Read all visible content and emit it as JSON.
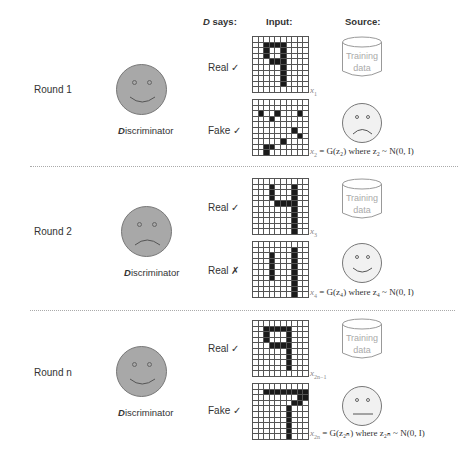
{
  "header": {
    "d_says_prefix": "D",
    "d_says_suffix": " says:",
    "input": "Input:",
    "source": "Source:"
  },
  "rounds": [
    {
      "label": "Round 1",
      "discriminator_mood": "happy",
      "discriminator_label_prefix": "D",
      "discriminator_label_suffix": "iscriminator",
      "rows": [
        {
          "verdict": "Real ✓",
          "digit": "9",
          "caption_var": "x",
          "caption_sub": "1",
          "caption_rest": "",
          "source": "training-data",
          "source_text": [
            "Training",
            "data"
          ]
        },
        {
          "verdict": "Fake ✓",
          "digit": "noise",
          "caption_var": "x",
          "caption_sub": "2",
          "caption_rest": " = G(z₂) where z₂  ~ N(0, I)",
          "source": "generator-sad"
        }
      ]
    },
    {
      "label": "Round 2",
      "discriminator_mood": "sad",
      "discriminator_label_prefix": "D",
      "discriminator_label_suffix": "iscriminator",
      "rows": [
        {
          "verdict": "Real ✓",
          "digit": "4",
          "caption_var": "x",
          "caption_sub": "3",
          "caption_rest": "",
          "source": "training-data",
          "source_text": [
            "Training",
            "data"
          ]
        },
        {
          "verdict": "Real ✗",
          "digit": "fake-4",
          "caption_var": "x",
          "caption_sub": "4",
          "caption_rest": " = G(z₄) where z₄  ~ N(0, I)",
          "source": "generator-happy"
        }
      ]
    },
    {
      "label": "Round n",
      "discriminator_mood": "happy",
      "discriminator_label_prefix": "D",
      "discriminator_label_suffix": "iscriminator",
      "rows": [
        {
          "verdict": "Real ✓",
          "digit": "9",
          "caption_var": "x",
          "caption_sub": "2n−1",
          "caption_rest": "",
          "source": "training-data",
          "source_text": [
            "Training",
            "data"
          ]
        },
        {
          "verdict": "Fake ✓",
          "digit": "7",
          "caption_var": "x",
          "caption_sub": "2n",
          "caption_rest": " = G(z₂ₙ) where z₂ₙ  ~ N(0, I)",
          "source": "generator-neutral"
        }
      ]
    }
  ],
  "grids": {
    "r1_real": [
      [
        1,
        2
      ],
      [
        1,
        3
      ],
      [
        1,
        4
      ],
      [
        1,
        5
      ],
      [
        2,
        2
      ],
      [
        2,
        5
      ],
      [
        3,
        2
      ],
      [
        3,
        5
      ],
      [
        4,
        3
      ],
      [
        4,
        4
      ],
      [
        4,
        5
      ],
      [
        5,
        5
      ],
      [
        6,
        5
      ],
      [
        7,
        5
      ],
      [
        8,
        5
      ]
    ],
    "r1_fake": [
      [
        2,
        1
      ],
      [
        2,
        4
      ],
      [
        2,
        8
      ],
      [
        3,
        3
      ],
      [
        5,
        7
      ],
      [
        6,
        8
      ],
      [
        7,
        5
      ],
      [
        8,
        2
      ],
      [
        8,
        3
      ],
      [
        9,
        2
      ]
    ],
    "r2_real": [
      [
        1,
        3
      ],
      [
        1,
        7
      ],
      [
        2,
        3
      ],
      [
        2,
        7
      ],
      [
        3,
        3
      ],
      [
        3,
        7
      ],
      [
        4,
        4
      ],
      [
        4,
        5
      ],
      [
        4,
        6
      ],
      [
        4,
        7
      ],
      [
        5,
        7
      ],
      [
        6,
        7
      ],
      [
        7,
        7
      ],
      [
        8,
        7
      ],
      [
        9,
        7
      ]
    ],
    "r2_fake": [
      [
        1,
        7
      ],
      [
        2,
        3
      ],
      [
        2,
        7
      ],
      [
        3,
        3
      ],
      [
        3,
        7
      ],
      [
        4,
        3
      ],
      [
        4,
        7
      ],
      [
        5,
        3
      ],
      [
        5,
        7
      ],
      [
        6,
        3
      ],
      [
        6,
        7
      ],
      [
        7,
        7
      ],
      [
        8,
        7
      ],
      [
        9,
        7
      ]
    ],
    "rn_real": [
      [
        1,
        2
      ],
      [
        1,
        3
      ],
      [
        1,
        4
      ],
      [
        1,
        5
      ],
      [
        1,
        6
      ],
      [
        2,
        2
      ],
      [
        2,
        6
      ],
      [
        3,
        2
      ],
      [
        3,
        6
      ],
      [
        4,
        3
      ],
      [
        4,
        4
      ],
      [
        4,
        5
      ],
      [
        4,
        6
      ],
      [
        5,
        6
      ],
      [
        6,
        6
      ],
      [
        7,
        6
      ],
      [
        8,
        6
      ]
    ],
    "rn_fake": [
      [
        1,
        2
      ],
      [
        1,
        3
      ],
      [
        1,
        4
      ],
      [
        1,
        5
      ],
      [
        1,
        6
      ],
      [
        1,
        7
      ],
      [
        1,
        8
      ],
      [
        1,
        9
      ],
      [
        2,
        8
      ],
      [
        2,
        9
      ],
      [
        3,
        7
      ],
      [
        3,
        8
      ],
      [
        4,
        6
      ],
      [
        5,
        6
      ],
      [
        6,
        6
      ],
      [
        7,
        6
      ],
      [
        8,
        6
      ],
      [
        9,
        6
      ]
    ]
  }
}
